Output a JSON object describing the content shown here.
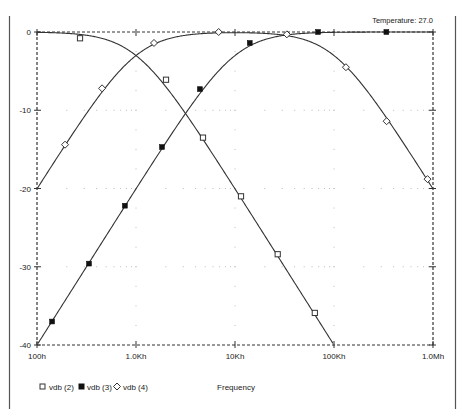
{
  "header": {
    "temperature_label": "Temperature: 27.0"
  },
  "chart_data": {
    "type": "line",
    "title": "",
    "xlabel": "Frequency",
    "ylabel": "",
    "xscale": "log",
    "xlim": [
      100,
      1000000
    ],
    "ylim": [
      -40,
      0
    ],
    "grid": true,
    "legend_position": "bottom-left",
    "x_ticks": [
      {
        "value": 100,
        "label": "100h"
      },
      {
        "value": 1000,
        "label": "1.0Kh"
      },
      {
        "value": 10000,
        "label": "10Kh"
      },
      {
        "value": 100000,
        "label": "100Kh"
      },
      {
        "value": 1000000,
        "label": "1.0Mh"
      }
    ],
    "y_ticks": [
      {
        "value": 0,
        "label": "0"
      },
      {
        "value": -10,
        "label": "-10"
      },
      {
        "value": -20,
        "label": "-20"
      },
      {
        "value": -30,
        "label": "-30"
      },
      {
        "value": -40,
        "label": "-40"
      }
    ],
    "series": [
      {
        "name": "vdb (2)",
        "marker": "square-open",
        "color": "#333333",
        "filter": {
          "kind": "lowpass",
          "fc": 1000
        },
        "points": [
          {
            "x": 272,
            "y": -0.8
          },
          {
            "x": 2010,
            "y": -6.1
          },
          {
            "x": 4750,
            "y": -13.5
          },
          {
            "x": 11500,
            "y": -21.0
          },
          {
            "x": 27000,
            "y": -28.4
          },
          {
            "x": 64000,
            "y": -35.9
          }
        ]
      },
      {
        "name": "vdb (3)",
        "marker": "square-filled",
        "color": "#333333",
        "filter": {
          "kind": "highpass",
          "fc": 10000
        },
        "points": [
          {
            "x": 142,
            "y": -37.0
          },
          {
            "x": 335,
            "y": -29.6
          },
          {
            "x": 772,
            "y": -22.2
          },
          {
            "x": 1830,
            "y": -14.7
          },
          {
            "x": 4420,
            "y": -7.3
          },
          {
            "x": 14100,
            "y": -1.4
          },
          {
            "x": 69000,
            "y": 0.0
          },
          {
            "x": 338000,
            "y": 0.0
          }
        ]
      },
      {
        "name": "vdb (4)",
        "marker": "diamond-open",
        "color": "#333333",
        "filter": {
          "kind": "bandpass",
          "fl": 1000,
          "fh": 100000
        },
        "points": [
          {
            "x": 192,
            "y": -14.4
          },
          {
            "x": 454,
            "y": -7.2
          },
          {
            "x": 1520,
            "y": -1.4
          },
          {
            "x": 6840,
            "y": 0.0
          },
          {
            "x": 33400,
            "y": -0.3
          },
          {
            "x": 132000,
            "y": -4.5
          },
          {
            "x": 340000,
            "y": -11.4
          },
          {
            "x": 880000,
            "y": -18.8
          }
        ]
      }
    ]
  }
}
